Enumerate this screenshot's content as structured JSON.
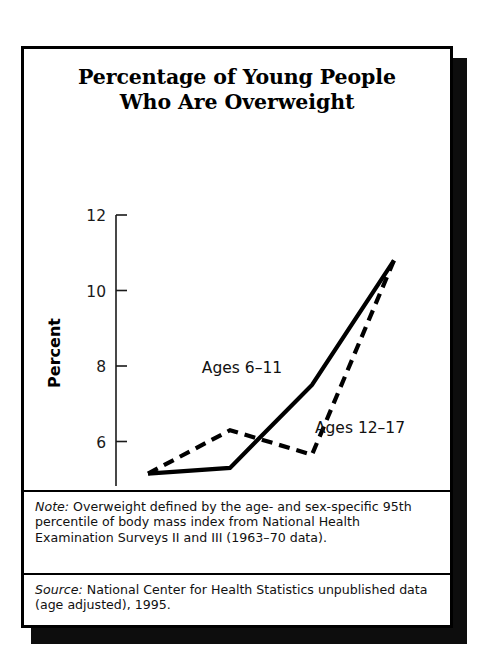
{
  "card": {
    "title_line_1": "Percentage of Young People",
    "title_line_2": "Who Are Overweight"
  },
  "footnotes": {
    "note_label": "Note:",
    "note_text": " Overweight defined by the age- and sex-specific 95th percentile of body mass index from National Health Examination Surveys II and III (1963–70 data).",
    "source_label": "Source:",
    "source_text": " National Center for Health Statistics unpublished data (age adjusted), 1995."
  },
  "chart_data": {
    "type": "line",
    "title": "Percentage of Young People Who Are Overweight",
    "xlabel": "",
    "ylabel": "Percent",
    "categories": [
      "1963–70",
      "1971–74",
      "1976–80",
      "1988–91"
    ],
    "ylim": [
      4,
      12
    ],
    "yticks": [
      4,
      6,
      8,
      10,
      12
    ],
    "ytick_labels": [
      "4",
      "6",
      "8",
      "10",
      "12"
    ],
    "grid": false,
    "legend_position": "inline-annotation",
    "series": [
      {
        "name": "Ages 6–11",
        "style": "solid",
        "color": "#000000",
        "values": [
          5.15,
          5.3,
          7.5,
          10.8
        ]
      },
      {
        "name": "Ages 12–17",
        "style": "dashed",
        "color": "#000000",
        "values": [
          5.15,
          6.3,
          5.65,
          10.8
        ]
      }
    ],
    "annotations": [
      {
        "text": "Ages 6–11",
        "x": 218,
        "y": 332
      },
      {
        "text": "Ages 12–17",
        "x": 336,
        "y": 392
      }
    ]
  }
}
